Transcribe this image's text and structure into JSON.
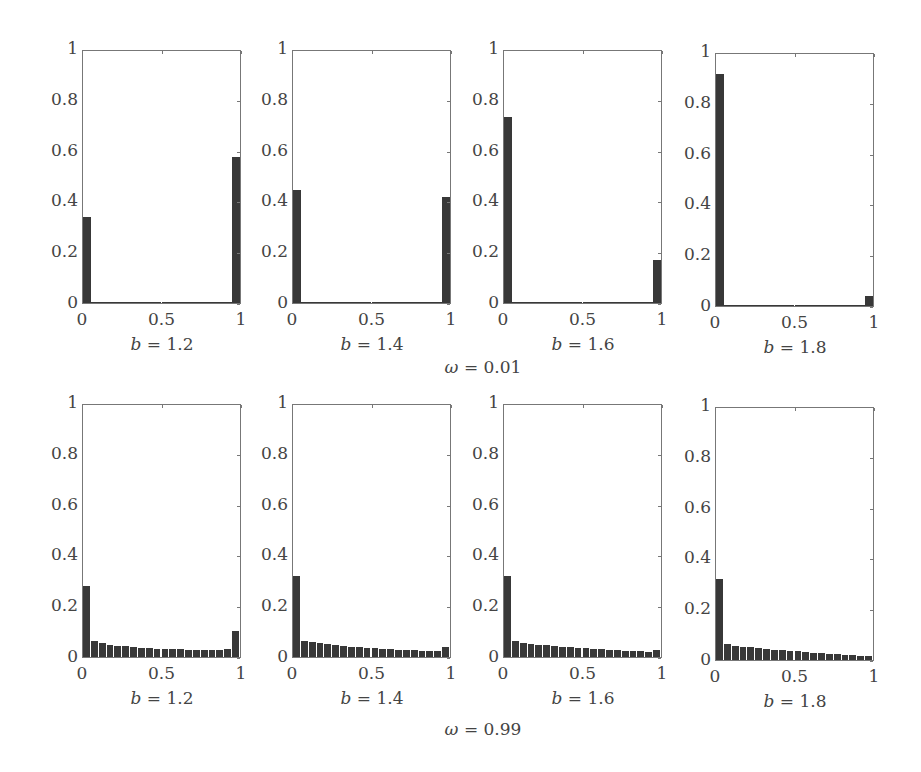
{
  "chart_data": [
    {
      "type": "bar",
      "row_label": "ω = 0.01",
      "omega": 0.01,
      "panels": [
        {
          "title": "b = 1.2",
          "b": 1.2,
          "xlim": [
            0,
            1
          ],
          "ylim": [
            0,
            1
          ],
          "xticks": [
            "0",
            "0.5",
            "1"
          ],
          "yticks": [
            "0",
            "0.2",
            "0.4",
            "0.6",
            "0.8",
            "1"
          ],
          "bins": 20,
          "values": [
            0.34,
            0.005,
            0.004,
            0.004,
            0.004,
            0.004,
            0.004,
            0.004,
            0.004,
            0.004,
            0.004,
            0.004,
            0.004,
            0.004,
            0.004,
            0.004,
            0.004,
            0.004,
            0.005,
            0.58
          ]
        },
        {
          "title": "b = 1.4",
          "b": 1.4,
          "xlim": [
            0,
            1
          ],
          "ylim": [
            0,
            1
          ],
          "xticks": [
            "0",
            "0.5",
            "1"
          ],
          "yticks": [
            "0",
            "0.2",
            "0.4",
            "0.6",
            "0.8",
            "1"
          ],
          "bins": 20,
          "values": [
            0.45,
            0.005,
            0.004,
            0.004,
            0.004,
            0.004,
            0.004,
            0.004,
            0.004,
            0.004,
            0.004,
            0.004,
            0.004,
            0.004,
            0.004,
            0.004,
            0.004,
            0.004,
            0.005,
            0.42
          ]
        },
        {
          "title": "b = 1.6",
          "b": 1.6,
          "xlim": [
            0,
            1
          ],
          "ylim": [
            0,
            1
          ],
          "xticks": [
            "0",
            "0.5",
            "1"
          ],
          "yticks": [
            "0",
            "0.2",
            "0.4",
            "0.6",
            "0.8",
            "1"
          ],
          "bins": 20,
          "values": [
            0.74,
            0.005,
            0.004,
            0.004,
            0.004,
            0.004,
            0.004,
            0.004,
            0.004,
            0.004,
            0.004,
            0.004,
            0.004,
            0.004,
            0.004,
            0.004,
            0.004,
            0.004,
            0.004,
            0.17
          ]
        },
        {
          "title": "b = 1.8",
          "b": 1.8,
          "xlim": [
            0,
            1
          ],
          "ylim": [
            0,
            1
          ],
          "xticks": [
            "0",
            "0.5",
            "1"
          ],
          "yticks": [
            "0",
            "0.2",
            "0.4",
            "0.6",
            "0.8",
            "1"
          ],
          "bins": 20,
          "values": [
            0.92,
            0.005,
            0.004,
            0.004,
            0.004,
            0.004,
            0.004,
            0.004,
            0.004,
            0.004,
            0.004,
            0.004,
            0.004,
            0.004,
            0.004,
            0.004,
            0.004,
            0.004,
            0.004,
            0.04
          ]
        }
      ]
    },
    {
      "type": "bar",
      "row_label": "ω = 0.99",
      "omega": 0.99,
      "panels": [
        {
          "title": "b = 1.2",
          "b": 1.2,
          "xlim": [
            0,
            1
          ],
          "ylim": [
            0,
            1
          ],
          "xticks": [
            "0",
            "0.5",
            "1"
          ],
          "yticks": [
            "0",
            "0.2",
            "0.4",
            "0.6",
            "0.8",
            "1"
          ],
          "bins": 20,
          "values": [
            0.28,
            0.065,
            0.055,
            0.048,
            0.044,
            0.042,
            0.039,
            0.037,
            0.035,
            0.032,
            0.031,
            0.03,
            0.03,
            0.029,
            0.029,
            0.028,
            0.028,
            0.028,
            0.03,
            0.105
          ]
        },
        {
          "title": "b = 1.4",
          "b": 1.4,
          "xlim": [
            0,
            1
          ],
          "ylim": [
            0,
            1
          ],
          "xticks": [
            "0",
            "0.5",
            "1"
          ],
          "yticks": [
            "0",
            "0.2",
            "0.4",
            "0.6",
            "0.8",
            "1"
          ],
          "bins": 20,
          "values": [
            0.32,
            0.065,
            0.058,
            0.054,
            0.05,
            0.046,
            0.043,
            0.04,
            0.038,
            0.036,
            0.034,
            0.032,
            0.03,
            0.028,
            0.027,
            0.026,
            0.025,
            0.024,
            0.023,
            0.038
          ]
        },
        {
          "title": "b = 1.6",
          "b": 1.6,
          "xlim": [
            0,
            1
          ],
          "ylim": [
            0,
            1
          ],
          "xticks": [
            "0",
            "0.5",
            "1"
          ],
          "yticks": [
            "0",
            "0.2",
            "0.4",
            "0.6",
            "0.8",
            "1"
          ],
          "bins": 20,
          "values": [
            0.32,
            0.062,
            0.057,
            0.052,
            0.049,
            0.046,
            0.043,
            0.041,
            0.039,
            0.036,
            0.034,
            0.032,
            0.03,
            0.028,
            0.026,
            0.025,
            0.024,
            0.022,
            0.02,
            0.026
          ]
        },
        {
          "title": "b = 1.8",
          "b": 1.8,
          "xlim": [
            0,
            1
          ],
          "ylim": [
            0,
            1
          ],
          "xticks": [
            "0",
            "0.5",
            "1"
          ],
          "yticks": [
            "0",
            "0.2",
            "0.4",
            "0.6",
            "0.8",
            "1"
          ],
          "bins": 20,
          "values": [
            0.32,
            0.062,
            0.057,
            0.053,
            0.05,
            0.047,
            0.044,
            0.041,
            0.039,
            0.036,
            0.034,
            0.031,
            0.029,
            0.027,
            0.025,
            0.023,
            0.021,
            0.019,
            0.017,
            0.015
          ]
        }
      ]
    }
  ],
  "colors": {
    "bar": "#383838",
    "axis": "#777777",
    "text": "#444444"
  }
}
